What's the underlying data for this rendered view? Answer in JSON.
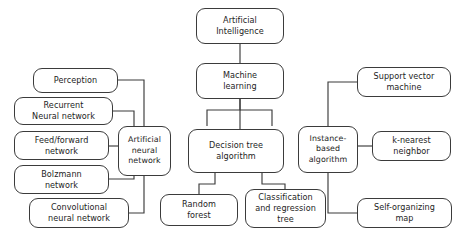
{
  "diagram": {
    "stroke_color": "#3b3b3b",
    "background_color": "#ffffff",
    "text_color": "#1d1d1d",
    "nodes": [
      {
        "id": "artificial_intelligence",
        "label": "Artificial\nIntelligence",
        "x": 196,
        "y": 8,
        "w": 88,
        "h": 36
      },
      {
        "id": "machine_learning",
        "label": "Machine\nlearning",
        "x": 196,
        "y": 63,
        "w": 88,
        "h": 36
      },
      {
        "id": "artificial_neural_network",
        "label": "Artificial\nneural\nnetwork",
        "x": 118,
        "y": 126,
        "w": 53,
        "h": 50
      },
      {
        "id": "decision_tree_algorithm",
        "label": "Decision tree\nalgorithm",
        "x": 188,
        "y": 129,
        "w": 96,
        "h": 44
      },
      {
        "id": "instance_based_algorithm",
        "label": "Instance-\nbased\nalgorithm",
        "x": 298,
        "y": 126,
        "w": 60,
        "h": 47
      },
      {
        "id": "perception",
        "label": "Perception",
        "x": 33,
        "y": 68,
        "w": 85,
        "h": 25
      },
      {
        "id": "recurrent_neural_network",
        "label": "Recurrent\nNeural network",
        "x": 14,
        "y": 97,
        "w": 99,
        "h": 28
      },
      {
        "id": "feed_forward_network",
        "label": "Feed/forward\nnetwork",
        "x": 14,
        "y": 131,
        "w": 95,
        "h": 29
      },
      {
        "id": "bolzmann_network",
        "label": "Bolzmann\nnetwork",
        "x": 14,
        "y": 165,
        "w": 95,
        "h": 29
      },
      {
        "id": "convolutional_neural_network",
        "label": "Convolutional\nneural network",
        "x": 29,
        "y": 198,
        "w": 100,
        "h": 30
      },
      {
        "id": "random_forest",
        "label": "Random\nforest",
        "x": 160,
        "y": 194,
        "w": 78,
        "h": 32
      },
      {
        "id": "classification_and_regression_tree",
        "label": "Classification\nand regression\ntree",
        "x": 245,
        "y": 189,
        "w": 81,
        "h": 39
      },
      {
        "id": "support_vector_machine",
        "label": "Support vector\nmachine",
        "x": 357,
        "y": 67,
        "w": 94,
        "h": 30
      },
      {
        "id": "k_nearest_neighbor",
        "label": "k-nearest\nneighbor",
        "x": 372,
        "y": 131,
        "w": 79,
        "h": 30
      },
      {
        "id": "self_organizing_map",
        "label": "Self-organizing\nmap",
        "x": 357,
        "y": 198,
        "w": 95,
        "h": 30
      }
    ],
    "edges": [
      {
        "from": "artificial_intelligence",
        "to": "machine_learning",
        "path": "M 240 44 L 240 63"
      },
      {
        "from": "machine_learning",
        "to": "artificial_neural_network",
        "path": "M 240 99 L 240 110 L 207 110 L 207 126"
      },
      {
        "from": "machine_learning",
        "to": "decision_tree_algorithm",
        "path": "M 240 99 L 240 129"
      },
      {
        "from": "machine_learning",
        "to": "instance_based_algorithm",
        "path": "M 240 110 L 272 110 L 272 126"
      },
      {
        "from": "perception",
        "to": "artificial_neural_network",
        "path": "M 118 80 L 144 80 L 144 126"
      },
      {
        "from": "recurrent_neural_network",
        "to": "artificial_neural_network",
        "path": "M 113 111 L 134 111 L 134 126"
      },
      {
        "from": "feed_forward_network",
        "to": "artificial_neural_network",
        "path": "M 109 146 L 118 146"
      },
      {
        "from": "bolzmann_network",
        "to": "artificial_neural_network",
        "path": "M 109 179 L 134 179 L 134 176"
      },
      {
        "from": "convolutional_neural_network",
        "to": "artificial_neural_network",
        "path": "M 129 213 L 144 213 L 144 176"
      },
      {
        "from": "decision_tree_algorithm",
        "to": "random_forest",
        "path": "M 215 173 L 215 184 L 199 184 L 199 194"
      },
      {
        "from": "decision_tree_algorithm",
        "to": "classification_and_regression_tree",
        "path": "M 262 173 L 262 184 L 285 184 L 285 189"
      },
      {
        "from": "instance_based_algorithm",
        "to": "support_vector_machine",
        "path": "M 328 126 L 328 82 L 357 82"
      },
      {
        "from": "instance_based_algorithm",
        "to": "k_nearest_neighbor",
        "path": "M 358 146 L 372 146"
      },
      {
        "from": "instance_based_algorithm",
        "to": "self_organizing_map",
        "path": "M 328 173 L 328 213 L 357 213"
      }
    ]
  }
}
